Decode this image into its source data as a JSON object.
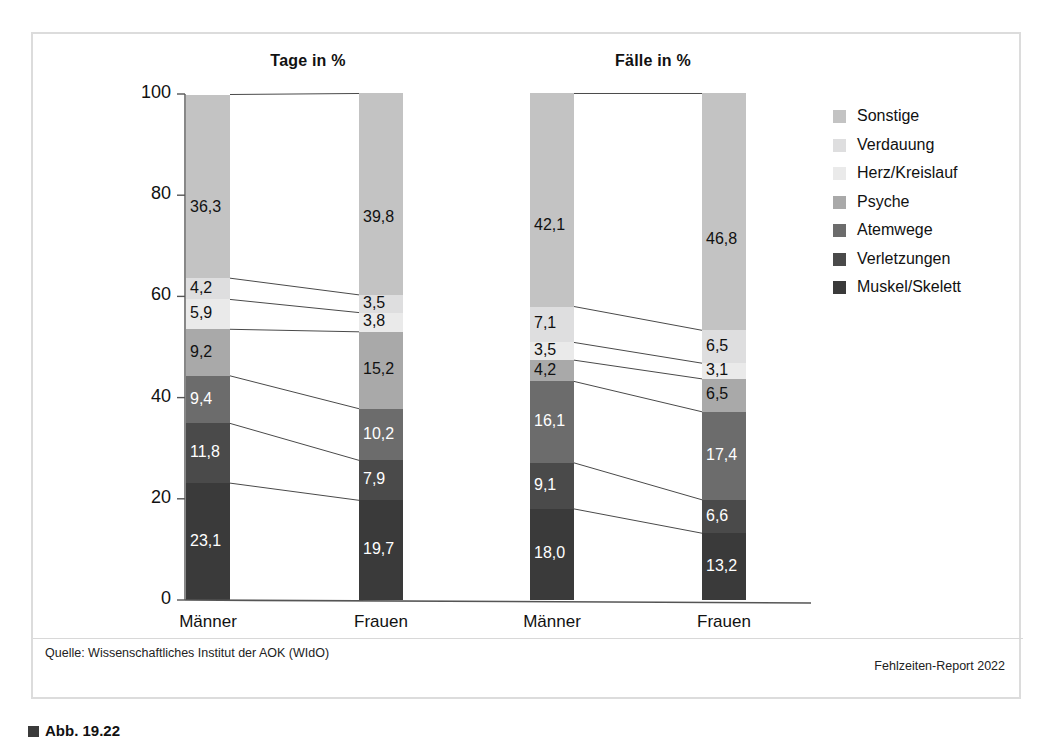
{
  "figure": {
    "source_note": "Quelle: Wissenschaftliches Institut der AOK (WIdO)",
    "report_note": "Fehlzeiten-Report 2022",
    "caption_prefix": "Abb. 19.22"
  },
  "axis": {
    "ticks": [
      "100",
      "80",
      "60",
      "40",
      "20",
      "0"
    ],
    "tick_values": [
      100,
      80,
      60,
      40,
      20,
      0
    ],
    "min": 0,
    "max": 100
  },
  "legend": {
    "position": "right",
    "items": [
      {
        "label": "Sonstige",
        "color": "#c3c3c3"
      },
      {
        "label": "Verdauung",
        "color": "#dededf"
      },
      {
        "label": "Herz/Kreislauf",
        "color": "#eaeaea"
      },
      {
        "label": "Psyche",
        "color": "#a9a9a9"
      },
      {
        "label": "Atemwege",
        "color": "#6c6c6c"
      },
      {
        "label": "Verletzungen",
        "color": "#4a4a4a"
      },
      {
        "label": "Muskel/Skelett",
        "color": "#3a3a3a"
      }
    ]
  },
  "chart_data": {
    "type": "bar",
    "title": "",
    "xlabel": "",
    "ylabel": "",
    "ylim": [
      0,
      100
    ],
    "grid": false,
    "stacked": true,
    "normalized_percent": true,
    "legend_position": "right",
    "panels": [
      {
        "title": "Tage in %",
        "categories": [
          "Männer",
          "Frauen"
        ],
        "series": [
          {
            "name": "Muskel/Skelett",
            "color": "#3a3a3a",
            "values": [
              23.1,
              19.7
            ],
            "labels": [
              "23,1",
              "19,7"
            ]
          },
          {
            "name": "Verletzungen",
            "color": "#4a4a4a",
            "values": [
              11.8,
              7.9
            ],
            "labels": [
              "11,8",
              "7,9"
            ]
          },
          {
            "name": "Atemwege",
            "color": "#6c6c6c",
            "values": [
              9.4,
              10.2
            ],
            "labels": [
              "9,4",
              "10,2"
            ]
          },
          {
            "name": "Psyche",
            "color": "#a9a9a9",
            "values": [
              9.2,
              15.2
            ],
            "labels": [
              "9,2",
              "15,2"
            ]
          },
          {
            "name": "Herz/Kreislauf",
            "color": "#eaeaea",
            "values": [
              5.9,
              3.8
            ],
            "labels": [
              "5,9",
              "3,8"
            ]
          },
          {
            "name": "Verdauung",
            "color": "#dededf",
            "values": [
              4.2,
              3.5
            ],
            "labels": [
              "4,2",
              "3,5"
            ]
          },
          {
            "name": "Sonstige",
            "color": "#c3c3c3",
            "values": [
              36.3,
              39.8
            ],
            "labels": [
              "36,3",
              "39,8"
            ]
          }
        ]
      },
      {
        "title": "Fälle in %",
        "categories": [
          "Männer",
          "Frauen"
        ],
        "series": [
          {
            "name": "Muskel/Skelett",
            "color": "#3a3a3a",
            "values": [
              18.0,
              13.2
            ],
            "labels": [
              "18,0",
              "13,2"
            ]
          },
          {
            "name": "Verletzungen",
            "color": "#4a4a4a",
            "values": [
              9.1,
              6.6
            ],
            "labels": [
              "9,1",
              "6,6"
            ]
          },
          {
            "name": "Atemwege",
            "color": "#6c6c6c",
            "values": [
              16.1,
              17.4
            ],
            "labels": [
              "16,1",
              "17,4"
            ]
          },
          {
            "name": "Psyche",
            "color": "#a9a9a9",
            "values": [
              4.2,
              6.5
            ],
            "labels": [
              "4,2",
              "6,5"
            ]
          },
          {
            "name": "Herz/Kreislauf",
            "color": "#eaeaea",
            "values": [
              3.5,
              3.1
            ],
            "labels": [
              "3,5",
              "3,1"
            ]
          },
          {
            "name": "Verdauung",
            "color": "#dededf",
            "values": [
              7.1,
              6.5
            ],
            "labels": [
              "7,1",
              "6,5"
            ]
          },
          {
            "name": "Sonstige",
            "color": "#c3c3c3",
            "values": [
              42.1,
              46.8
            ],
            "labels": [
              "42,1",
              "46,8"
            ]
          }
        ]
      }
    ]
  }
}
